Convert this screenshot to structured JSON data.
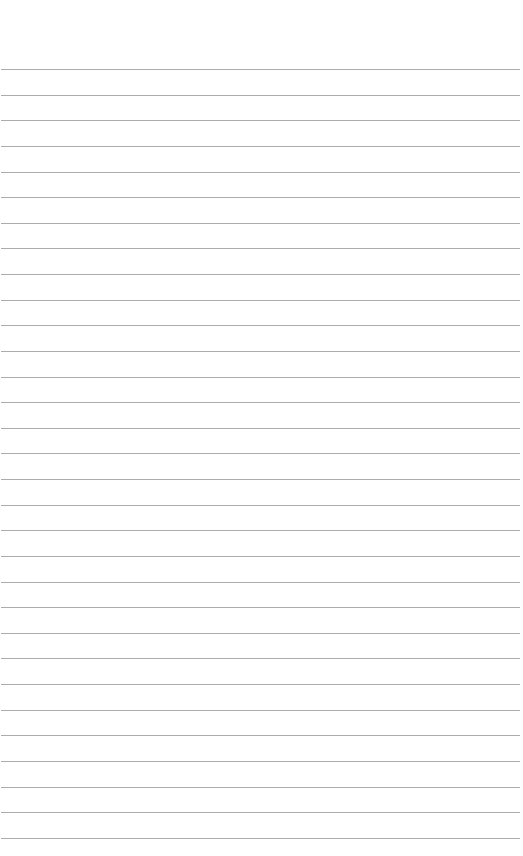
{
  "page": {
    "type": "lined-paper",
    "background": "#ffffff",
    "rule_color": "#9e9e9e",
    "first_rule_y": 69,
    "rule_spacing": 25.63,
    "rule_count": 31
  }
}
